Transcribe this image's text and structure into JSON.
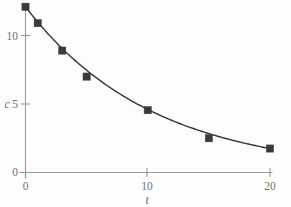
{
  "chart_data": {
    "type": "scatter",
    "title": "",
    "subtitle": "",
    "xlabel": "t",
    "ylabel": "c",
    "xlim": [
      0,
      20.2
    ],
    "ylim": [
      0,
      12.7
    ],
    "grid": false,
    "legend": "none",
    "x": [
      0,
      1,
      3,
      5,
      10,
      15,
      20
    ],
    "values": [
      12.1,
      10.9,
      8.9,
      7.0,
      4.55,
      2.5,
      1.75
    ],
    "series": [
      {
        "name": "concentration",
        "marker": "filled-square",
        "marker_color": "#3b3b3b",
        "line": "smooth-exponential-fit",
        "line_color": "#3a3a3a",
        "values": [
          12.1,
          10.9,
          8.9,
          7.0,
          4.55,
          2.5,
          1.75
        ]
      }
    ],
    "xticks": [
      0,
      10,
      20
    ],
    "xticklabels": [
      "0",
      "10",
      "20"
    ],
    "yticks": [
      0,
      5,
      10
    ],
    "yticklabels": [
      "0",
      "5",
      "10"
    ],
    "annotations": []
  },
  "axes": {
    "y_axis_label": "c",
    "x_axis_label": "t",
    "y_tick_0": "0",
    "y_tick_5": "5",
    "y_tick_10": "10",
    "x_tick_0": "0",
    "x_tick_10": "10",
    "x_tick_20": "20"
  },
  "colors": {
    "background": "#fdfdfd",
    "axis": "#9a9a9a",
    "tick_text": "#6f6f6f",
    "curve": "#3a3a3a",
    "marker": "#3b3b3b"
  }
}
